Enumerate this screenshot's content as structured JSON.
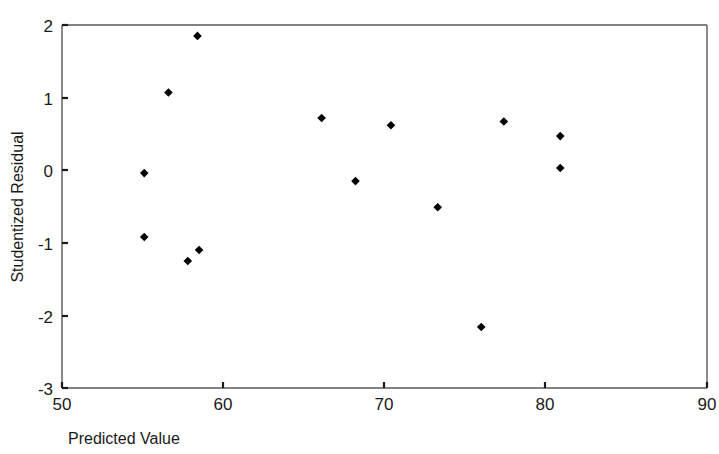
{
  "chart_data": {
    "type": "scatter",
    "title": "",
    "subtitle": "",
    "xlabel": "Predicted Value",
    "ylabel": "Studentized Residual",
    "xlim": [
      50,
      90
    ],
    "ylim": [
      -3,
      2
    ],
    "xticks": [
      50,
      60,
      70,
      80,
      90
    ],
    "yticks": [
      2,
      1,
      0,
      -1,
      -2,
      -3
    ],
    "xtick_labels": [
      "50",
      "60",
      "70",
      "80",
      "90"
    ],
    "ytick_labels": [
      "2",
      "1",
      "0",
      "-1",
      "-2",
      "-3"
    ],
    "grid": false,
    "legend": false,
    "legend_position": "none",
    "marker_shape": "diamond",
    "marker_color": "#000000",
    "marker_size": 7,
    "axis_color": "#555a5e",
    "background_color": "#ffffff",
    "n_points": 14,
    "points": [
      {
        "x": 55.1,
        "y": -0.04
      },
      {
        "x": 55.1,
        "y": -0.92
      },
      {
        "x": 56.6,
        "y": 1.07
      },
      {
        "x": 57.8,
        "y": -1.25
      },
      {
        "x": 58.4,
        "y": 1.85
      },
      {
        "x": 58.5,
        "y": -1.1
      },
      {
        "x": 66.1,
        "y": 0.72
      },
      {
        "x": 68.2,
        "y": -0.15
      },
      {
        "x": 70.4,
        "y": 0.62
      },
      {
        "x": 73.3,
        "y": -0.51
      },
      {
        "x": 76.0,
        "y": -2.16
      },
      {
        "x": 77.4,
        "y": 0.67
      },
      {
        "x": 80.9,
        "y": 0.47
      },
      {
        "x": 80.9,
        "y": 0.03
      }
    ],
    "x": [
      55.1,
      55.1,
      56.6,
      57.8,
      58.4,
      58.5,
      66.1,
      68.2,
      70.4,
      73.3,
      76.0,
      77.4,
      80.9,
      80.9
    ],
    "values": [
      -0.04,
      -0.92,
      1.07,
      -1.25,
      1.85,
      -1.1,
      0.72,
      -0.15,
      0.62,
      -0.51,
      -2.16,
      0.67,
      0.47,
      0.03
    ]
  },
  "axes": {
    "x_title": "Predicted Value",
    "y_title": "Studentized Residual"
  }
}
